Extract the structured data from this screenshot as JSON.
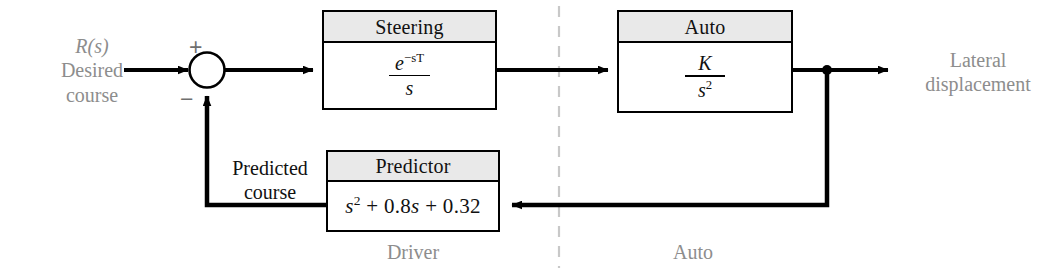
{
  "diagram": {
    "canvas": {
      "width": 1053,
      "height": 274
    },
    "colors": {
      "line": "#000000",
      "block_header_fill": "#e9e9e9",
      "gray_label": "#8d8d8d",
      "black_label": "#111111",
      "divider": "#c8c8c8"
    }
  },
  "input": {
    "symbol": "R(s)",
    "line1": "Desired",
    "line2": "course"
  },
  "summing_junction": {
    "name": "summing-junction",
    "plus": "+",
    "minus": "−"
  },
  "blocks": [
    {
      "id": "steering",
      "header": "Steering",
      "transfer_numerator": "e",
      "transfer_numerator_exp": "−sT",
      "transfer_denominator": "s",
      "transfer_function": "e^(-sT)/s"
    },
    {
      "id": "auto",
      "header": "Auto",
      "transfer_numerator": "K",
      "transfer_denominator": "s",
      "transfer_denominator_exp": "2",
      "transfer_function": "K/s^2"
    },
    {
      "id": "predictor",
      "header": "Predictor",
      "transfer_function_text": "+ 0.8",
      "poly_s": "s",
      "poly_s_exp": "2",
      "poly_mid": "+ 0.8",
      "poly_s2": "s",
      "poly_tail": "+ 0.32",
      "transfer_function": "s^2 + 0.8s + 0.32"
    }
  ],
  "feedback": {
    "label_line1": "Predicted",
    "label_line2": "course"
  },
  "output": {
    "line1": "Lateral",
    "line2": "displacement"
  },
  "section_labels": {
    "left": "Driver",
    "right": "Auto"
  }
}
